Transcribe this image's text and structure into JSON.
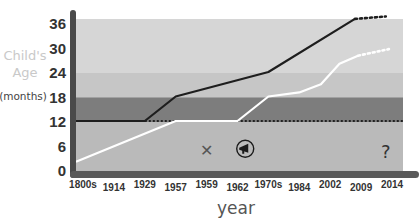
{
  "chart_data": {
    "type": "line",
    "title": "",
    "xlabel": "year",
    "ylabel": [
      "Child's",
      "Age",
      "(months)"
    ],
    "ylim": [
      0,
      36
    ],
    "yticks": [
      0,
      6,
      12,
      18,
      24,
      30,
      36
    ],
    "categories": [
      "1800s",
      "1914",
      "1929",
      "1957",
      "1959",
      "1962",
      "1970s",
      "1984",
      "2002",
      "2009",
      "2014"
    ],
    "bands": [
      {
        "from": 0,
        "to": 12,
        "color": "#bababa"
      },
      {
        "from": 12,
        "to": 18,
        "color": "#7d7d7d"
      },
      {
        "from": 18,
        "to": 24,
        "color": "#c6c6c6"
      },
      {
        "from": 24,
        "to": 36,
        "color": "#d6d6d6"
      }
    ],
    "reference_line": {
      "y": 12,
      "from": "1929",
      "style": "dotted",
      "color": "#222222"
    },
    "series": [
      {
        "name": "upper",
        "color": "#1e1e1e",
        "points": [
          {
            "x": 0,
            "y": 12
          },
          {
            "x": 2,
            "y": 12
          },
          {
            "x": 3,
            "y": 18
          },
          {
            "x": 6,
            "y": 24
          },
          {
            "x": 8.8,
            "y": 37
          }
        ],
        "projection": [
          {
            "x": 8.8,
            "y": 37
          },
          {
            "x": 9.8,
            "y": 37.6
          }
        ]
      },
      {
        "name": "lower",
        "color": "#ffffff",
        "points": [
          {
            "x": 0,
            "y": 2
          },
          {
            "x": 3,
            "y": 12
          },
          {
            "x": 5,
            "y": 12
          },
          {
            "x": 6,
            "y": 18
          },
          {
            "x": 7,
            "y": 19
          },
          {
            "x": 7.7,
            "y": 21
          },
          {
            "x": 8.3,
            "y": 26
          },
          {
            "x": 8.9,
            "y": 28
          }
        ],
        "projection": [
          {
            "x": 8.9,
            "y": 28
          },
          {
            "x": 9.9,
            "y": 29.6
          }
        ]
      }
    ],
    "annotations": [
      {
        "icon": "x-mark-icon",
        "text": "✕",
        "x": 4.0,
        "y": 4.8
      },
      {
        "icon": "megaphone-icon",
        "x": 5.25,
        "y": 5.2
      },
      {
        "icon": "question-icon",
        "text": "?",
        "x": 9.8,
        "y": 4.5
      }
    ]
  }
}
